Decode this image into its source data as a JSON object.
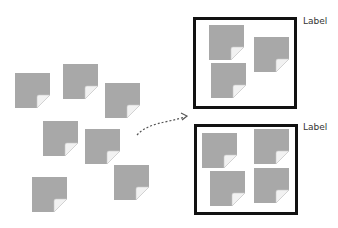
{
  "diagram": {
    "colors": {
      "note": "#a8a8a8",
      "border": "#111111",
      "arrow": "#555555"
    },
    "loose_notes": [
      {
        "x": 15,
        "y": 73
      },
      {
        "x": 63,
        "y": 64
      },
      {
        "x": 105,
        "y": 83
      },
      {
        "x": 43,
        "y": 121
      },
      {
        "x": 85,
        "y": 129
      },
      {
        "x": 32,
        "y": 177
      },
      {
        "x": 114,
        "y": 165
      }
    ],
    "groups": [
      {
        "label": "Label",
        "box": {
          "x": 193,
          "y": 17,
          "w": 104,
          "h": 92
        },
        "notes": [
          {
            "x": 209,
            "y": 25
          },
          {
            "x": 254,
            "y": 37
          },
          {
            "x": 211,
            "y": 63
          }
        ]
      },
      {
        "label": "Label",
        "box": {
          "x": 194,
          "y": 124,
          "w": 104,
          "h": 91
        },
        "notes": [
          {
            "x": 202,
            "y": 133
          },
          {
            "x": 254,
            "y": 129
          },
          {
            "x": 210,
            "y": 171
          },
          {
            "x": 254,
            "y": 168
          }
        ]
      }
    ],
    "arrow": {
      "style": "dashed",
      "direction": "to-top-group"
    }
  }
}
